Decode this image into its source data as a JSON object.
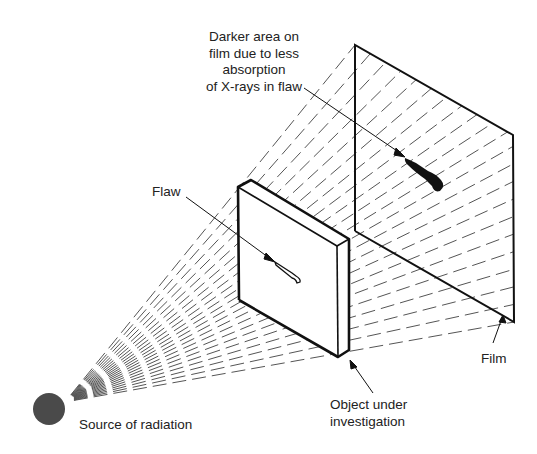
{
  "labels": {
    "darker_area": [
      "Darker area on",
      "film due to less",
      "absorption",
      "of X-rays in flaw"
    ],
    "flaw": "Flaw",
    "object": [
      "Object under",
      "investigation"
    ],
    "film": "Film",
    "source": "Source of radiation"
  },
  "colors": {
    "line": "#111111",
    "ray": "#555555",
    "source": "#4a4a4a",
    "text": "#222222"
  },
  "geometry": {
    "source": {
      "cx": 49,
      "cy": 409,
      "r": 16
    },
    "ray_origin": [
      65,
      402
    ],
    "film": {
      "tl": [
        355,
        45
      ],
      "tr": [
        513,
        135
      ],
      "br": [
        514,
        322
      ],
      "bl": [
        355,
        231
      ]
    },
    "object": {
      "front_tl": [
        238,
        187
      ],
      "back_tl": [
        251,
        180
      ],
      "front_tr": [
        337,
        246
      ],
      "back_tr": [
        349,
        239
      ],
      "front_bl": [
        239,
        300
      ],
      "front_br": [
        338,
        357
      ],
      "back_br": [
        349,
        350
      ]
    },
    "ray_count": 22
  }
}
